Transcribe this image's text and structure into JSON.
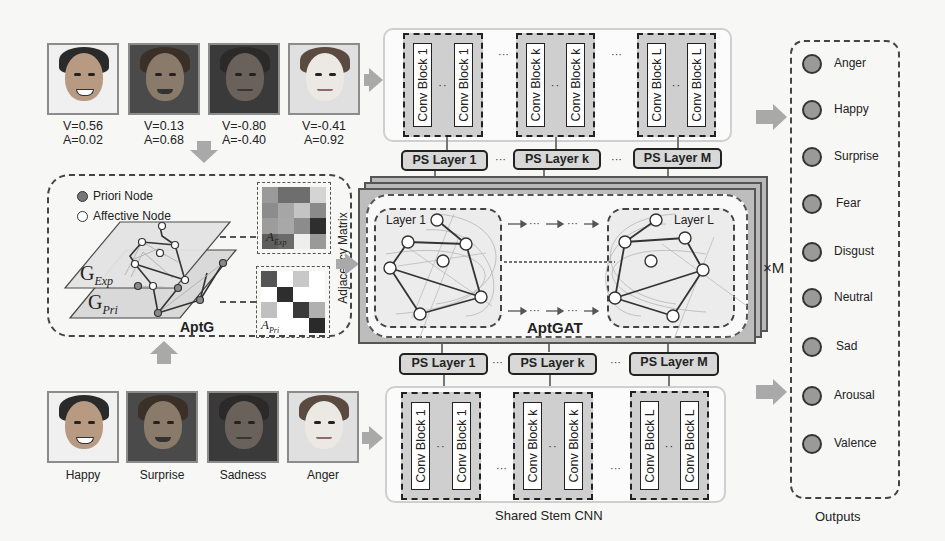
{
  "figure": {
    "top_faces": [
      {
        "v": "V=0.56",
        "a": "A=0.02",
        "tone": "#d8c4b0",
        "hair": "#2a2a2a",
        "bg": "#f0f0f0"
      },
      {
        "v": "V=0.13",
        "a": "A=0.68",
        "tone": "#8a7a6a",
        "hair": "#3a3028",
        "bg": "#4a4a4a"
      },
      {
        "v": "V=-0.80",
        "a": "A=-0.40",
        "tone": "#6a625a",
        "hair": "#2c2a28",
        "bg": "#3a3a3a"
      },
      {
        "v": "V=-0.41",
        "a": "A=0.92",
        "tone": "#ece8e4",
        "hair": "#5a4a40",
        "bg": "#e0e0e0"
      }
    ],
    "bottom_faces": [
      {
        "label": "Happy",
        "tone": "#d8c4b0",
        "hair": "#2a2a2a",
        "bg": "#f0f0f0"
      },
      {
        "label": "Surprise",
        "tone": "#8a7a6a",
        "hair": "#3a3028",
        "bg": "#4a4a4a"
      },
      {
        "label": "Sadness",
        "tone": "#6a625a",
        "hair": "#2c2a28",
        "bg": "#3a3a3a"
      },
      {
        "label": "Anger",
        "tone": "#ece8e4",
        "hair": "#5a4a40",
        "bg": "#e0e0e0"
      }
    ],
    "aptg": {
      "title": "AptG",
      "legend": [
        {
          "label": "Priori Node",
          "marker": "filled-gray"
        },
        {
          "label": "Affective Node",
          "marker": "hollow"
        }
      ],
      "graph_exp_label": "G",
      "graph_exp_sub": "Exp",
      "graph_pri_label": "G",
      "graph_pri_sub": "Pri",
      "matrix_exp_label": "A",
      "matrix_exp_sub": "Exp",
      "matrix_pri_label": "A",
      "matrix_pri_sub": "Pri",
      "matrix_exp_cells": [
        "#9a9a9a",
        "#6e6e6e",
        "#6e6e6e",
        "#d4d4d4",
        "#8c8c8c",
        "#a6a6a6",
        "#c4c4c4",
        "#8a8a8a",
        "#9c9c9c",
        "#a8a8a8",
        "#8c8c8c",
        "#2e2e2e",
        "#5e5e5e",
        "#6a6a6a",
        "#eeeeee",
        "#9a9a9a"
      ],
      "matrix_pri_cells": [
        "#555555",
        "#ffffff",
        "#c8c8c8",
        "#ffffff",
        "#ffffff",
        "#2e2e2e",
        "#ffffff",
        "#ffffff",
        "#c0c0c0",
        "#ffffff",
        "#3a3a3a",
        "#b0b0b0",
        "#ffffff",
        "#ffffff",
        "#ffffff",
        "#2a2a2a"
      ]
    },
    "adjacency_label": "Adjacency Matrix",
    "aptgat": {
      "title": "AptGAT",
      "layer_first": "Layer 1",
      "layer_last": "Layer L",
      "repeat_label": "×M",
      "flow_ellipsis": "···"
    },
    "top_cnn": {
      "groups": [
        {
          "blocks": [
            "Conv Block 1",
            "Conv Block 1"
          ]
        },
        {
          "blocks": [
            "Conv Block k",
            "Conv Block k"
          ]
        },
        {
          "blocks": [
            "Conv Block L",
            "Conv Block L"
          ]
        }
      ]
    },
    "bottom_cnn": {
      "caption": "Shared Stem CNN",
      "groups": [
        {
          "blocks": [
            "Conv Block 1",
            "Conv Block 1"
          ]
        },
        {
          "blocks": [
            "Conv Block k",
            "Conv Block k"
          ]
        },
        {
          "blocks": [
            "Conv Block L",
            "Conv Block L"
          ]
        }
      ]
    },
    "ps_layers_top": [
      "PS Layer 1",
      "PS Layer k",
      "PS Layer M"
    ],
    "ps_layers_bottom": [
      "PS Layer 1",
      "PS Layer k",
      "PS Layer M"
    ],
    "ellipsis": "···",
    "inner_ellipsis": "··",
    "outputs": {
      "caption": "Outputs",
      "items": [
        "Anger",
        "Happy",
        "Surprise",
        "Fear",
        "Disgust",
        "Neutral",
        "Sad",
        "Arousal",
        "Valence"
      ]
    },
    "colors": {
      "arrow_gray": "#a9a9a9",
      "block_fill": "#cfcfcf",
      "ps_fill": "#d8d8d8",
      "node_fill": "#9a9a9a"
    }
  }
}
